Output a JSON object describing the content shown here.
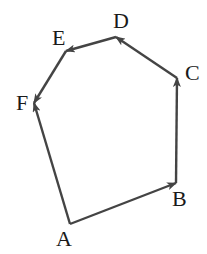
{
  "diagram": {
    "type": "vector-polygon",
    "stroke_color": "#444444",
    "label_color": "#1a1a1a",
    "vertices": [
      {
        "id": "A",
        "label": "A",
        "x": 70,
        "y": 224,
        "lx": 56,
        "ly": 246
      },
      {
        "id": "B",
        "label": "B",
        "x": 176,
        "y": 183,
        "lx": 172,
        "ly": 206
      },
      {
        "id": "C",
        "label": "C",
        "x": 177,
        "y": 78,
        "lx": 185,
        "ly": 80
      },
      {
        "id": "D",
        "label": "D",
        "x": 116,
        "y": 37,
        "lx": 113,
        "ly": 28
      },
      {
        "id": "E",
        "label": "E",
        "x": 66,
        "y": 51,
        "lx": 52,
        "ly": 45
      },
      {
        "id": "F",
        "label": "F",
        "x": 34,
        "y": 103,
        "lx": 16,
        "ly": 110
      }
    ],
    "edges": [
      {
        "from": "A",
        "to": "B",
        "arrow_at": "B"
      },
      {
        "from": "B",
        "to": "C",
        "arrow_at": "C"
      },
      {
        "from": "C",
        "to": "D",
        "arrow_at": "D"
      },
      {
        "from": "D",
        "to": "E",
        "arrow_at": "E"
      },
      {
        "from": "E",
        "to": "F",
        "arrow_at": "F"
      },
      {
        "from": "A",
        "to": "F",
        "arrow_at": "F"
      }
    ]
  }
}
